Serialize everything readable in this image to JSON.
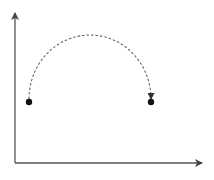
{
  "diagram": {
    "colors": {
      "axis": "#555555",
      "arc": "#666666",
      "point": "#111111",
      "background": "#ffffff"
    },
    "axes": {
      "origin": [
        15,
        163
      ],
      "y_axis_top": [
        15,
        12
      ],
      "x_axis_end": [
        203,
        163
      ],
      "x_label": "",
      "y_label": ""
    },
    "points": [
      {
        "id": "start",
        "x": 29,
        "y": 102
      },
      {
        "id": "end",
        "x": 151,
        "y": 102
      }
    ],
    "arc": {
      "from": "start",
      "to": "end",
      "style": "dashed",
      "arrowhead_at": "end",
      "apex_y": 37
    }
  }
}
